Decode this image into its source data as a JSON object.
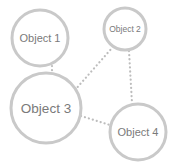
{
  "diagram": {
    "type": "network",
    "colors": {
      "node_stroke": "#c9c9c9",
      "edge_stroke": "#bdbdbd",
      "label": "#7a7a7a",
      "background": "#ffffff"
    },
    "nodes": [
      {
        "id": "n1",
        "label": "Object 1",
        "cx": 40,
        "cy": 38,
        "r": 28,
        "font_size": 11
      },
      {
        "id": "n2",
        "label": "Object 2",
        "cx": 125,
        "cy": 29,
        "r": 21,
        "font_size": 8.5
      },
      {
        "id": "n3",
        "label": "Object 3",
        "cx": 46,
        "cy": 108,
        "r": 35,
        "font_size": 13.5
      },
      {
        "id": "n4",
        "label": "Object 4",
        "cx": 138,
        "cy": 132,
        "r": 28,
        "font_size": 11
      }
    ],
    "edges": [
      {
        "from": "n1",
        "to": "n3",
        "x1": 52,
        "y1": 66,
        "x2": 52,
        "y2": 74,
        "style": "dotted"
      },
      {
        "from": "n3",
        "to": "n2",
        "x1": 75,
        "y1": 90,
        "x2": 112,
        "y2": 48,
        "style": "dotted"
      },
      {
        "from": "n2",
        "to": "n4",
        "x1": 129,
        "y1": 51,
        "x2": 132,
        "y2": 103,
        "style": "dotted"
      },
      {
        "from": "n3",
        "to": "n4",
        "x1": 81,
        "y1": 116,
        "x2": 110,
        "y2": 125,
        "style": "dotted"
      }
    ]
  }
}
